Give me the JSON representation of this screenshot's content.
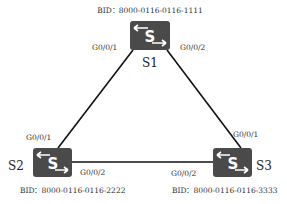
{
  "diagram": {
    "title": "",
    "colors": {
      "switch_body": "#4a4a4a",
      "switch_glyph": "#ffffff",
      "link": "#111111",
      "text": "#333333"
    },
    "nodes": [
      {
        "id": "S1",
        "name": "S1",
        "icon": "switch-icon",
        "bid_label": "BID：8000-0116-0116-1111"
      },
      {
        "id": "S2",
        "name": "S2",
        "icon": "switch-icon",
        "bid_label": "BID：8000-0116-0116-2222"
      },
      {
        "id": "S3",
        "name": "S3",
        "icon": "switch-icon",
        "bid_label": "BID：8000-0116-0116-3333"
      }
    ],
    "links": [
      {
        "from": "S1",
        "from_port": "G0/0/1",
        "to": "S2",
        "to_port": "G0/0/1"
      },
      {
        "from": "S1",
        "from_port": "G0/0/2",
        "to": "S3",
        "to_port": "G0/0/1"
      },
      {
        "from": "S2",
        "from_port": "G0/0/2",
        "to": "S3",
        "to_port": "G0/0/2"
      }
    ]
  }
}
